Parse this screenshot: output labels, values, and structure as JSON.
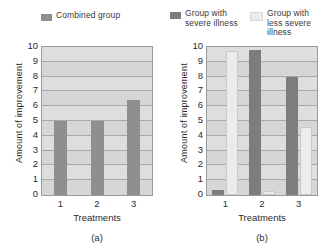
{
  "chart_data": [
    {
      "type": "bar",
      "panel": "a",
      "caption": "(a)",
      "title": "",
      "xlabel": "Treatments",
      "ylabel": "Amount of improvement",
      "categories": [
        "1",
        "2",
        "3"
      ],
      "ylim": [
        0,
        10
      ],
      "yticks": [
        0,
        1,
        2,
        3,
        4,
        5,
        6,
        7,
        8,
        9,
        10
      ],
      "grid": true,
      "legend_position": "top",
      "series": [
        {
          "name": "Combined group",
          "color": "#8f8f8f",
          "values": [
            5.0,
            5.0,
            6.4
          ]
        }
      ]
    },
    {
      "type": "bar",
      "panel": "b",
      "caption": "(b)",
      "title": "",
      "xlabel": "Treatments",
      "ylabel": "Amount of improvement",
      "categories": [
        "1",
        "2",
        "3"
      ],
      "ylim": [
        0,
        10
      ],
      "yticks": [
        0,
        1,
        2,
        3,
        4,
        5,
        6,
        7,
        8,
        9,
        10
      ],
      "grid": true,
      "legend_position": "top",
      "series": [
        {
          "name": "Group with\nsevere illness",
          "color": "#7d7d7d",
          "values": [
            0.35,
            9.8,
            8.0
          ]
        },
        {
          "name": "Group with\nless severe\nillness",
          "color": "#ececec",
          "values": [
            9.7,
            0.3,
            4.6
          ]
        }
      ]
    }
  ],
  "panel_a": {
    "ylabel": "Amount of improvement",
    "xlabel": "Treatments",
    "caption": "(a)",
    "legend": [
      {
        "label": "Combined group",
        "color": "#8f8f8f"
      }
    ],
    "yticks": [
      "10",
      "9",
      "8",
      "7",
      "6",
      "5",
      "4",
      "3",
      "2",
      "1",
      "0"
    ],
    "xticks": [
      "1",
      "2",
      "3"
    ]
  },
  "panel_b": {
    "ylabel": "Amount of improvement",
    "xlabel": "Treatments",
    "caption": "(b)",
    "legend": [
      {
        "label": "Group with\nsevere illness",
        "color": "#7d7d7d"
      },
      {
        "label": "Group with\nless severe\nillness",
        "color": "#ececec"
      }
    ],
    "yticks": [
      "10",
      "9",
      "8",
      "7",
      "6",
      "5",
      "4",
      "3",
      "2",
      "1",
      "0"
    ],
    "xticks": [
      "1",
      "2",
      "3"
    ]
  }
}
